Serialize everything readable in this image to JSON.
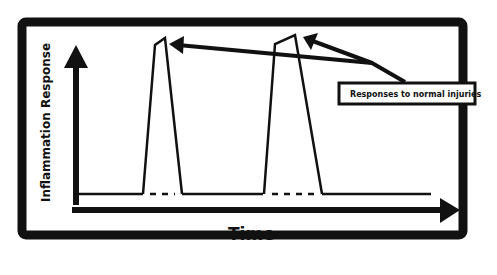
{
  "diagram": {
    "y_axis_label": "Inflammation Response",
    "x_axis_label": "Time",
    "callout_label": "Responses to normal injuries",
    "series": {
      "description": "Baseline inflammation with two transient spikes (normal injury responses) that return to baseline",
      "peaks": 2
    },
    "colors": {
      "stroke": "#111111",
      "background": "#ffffff"
    }
  }
}
